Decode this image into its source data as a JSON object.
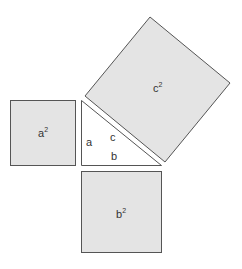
{
  "diagram": {
    "colors": {
      "square_fill": "#e4e4e4",
      "stroke": "#555555",
      "triangle_fill": "#ffffff",
      "text": "#333333"
    },
    "triangle": {
      "side_labels": {
        "a": "a",
        "b": "b",
        "c": "c"
      }
    },
    "squares": {
      "a_sq": {
        "base": "a",
        "exp": "2"
      },
      "b_sq": {
        "base": "b",
        "exp": "2"
      },
      "c_sq": {
        "base": "c",
        "exp": "2"
      }
    }
  }
}
